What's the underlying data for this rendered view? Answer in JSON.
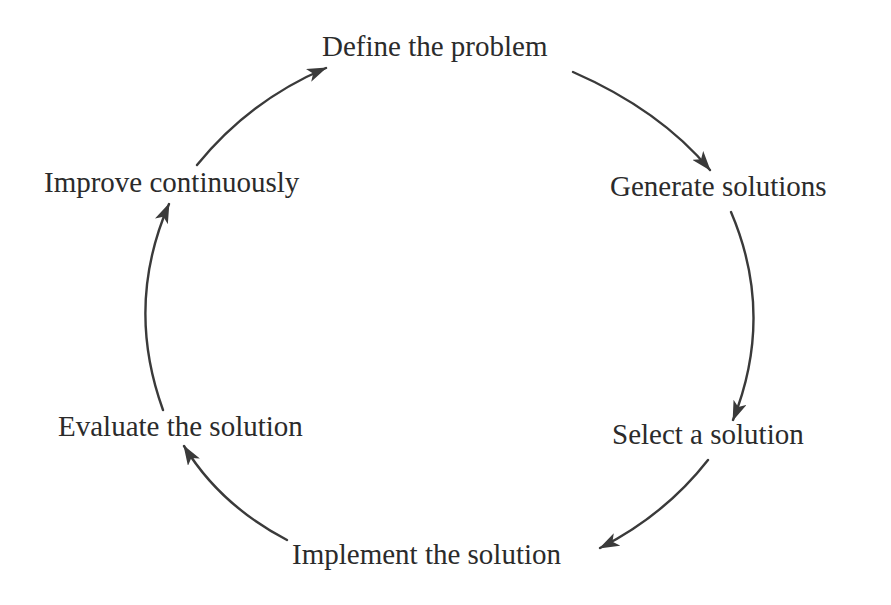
{
  "diagram": {
    "type": "cycle",
    "line_color": "#3a3a3a",
    "text_color": "#2b2b2b",
    "nodes": [
      {
        "id": "define",
        "label": "Define the problem"
      },
      {
        "id": "generate",
        "label": "Generate solutions"
      },
      {
        "id": "select",
        "label": "Select a solution"
      },
      {
        "id": "implement",
        "label": "Implement the solution"
      },
      {
        "id": "evaluate",
        "label": "Evaluate the solution"
      },
      {
        "id": "improve",
        "label": "Improve continuously"
      }
    ],
    "edges": [
      {
        "from": "define",
        "to": "generate"
      },
      {
        "from": "generate",
        "to": "select"
      },
      {
        "from": "select",
        "to": "implement"
      },
      {
        "from": "implement",
        "to": "evaluate"
      },
      {
        "from": "evaluate",
        "to": "improve"
      },
      {
        "from": "improve",
        "to": "define"
      }
    ]
  }
}
